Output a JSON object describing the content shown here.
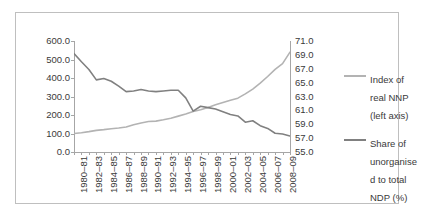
{
  "chart_data": {
    "type": "line",
    "title": "",
    "xlabel": "",
    "ylabel": "",
    "grid": false,
    "legend_position": "right",
    "x": [
      "1980-81",
      "1981-82",
      "1982-83",
      "1983-84",
      "1984-85",
      "1985-86",
      "1986-87",
      "1987-88",
      "1988-89",
      "1989-90",
      "1990-91",
      "1991-92",
      "1992-93",
      "1993-94",
      "1994-95",
      "1995-96",
      "1996-97",
      "1997-98",
      "1998-99",
      "1999-2000",
      "2000-01",
      "2001-02",
      "2002-03",
      "2003-04",
      "2004-05",
      "2005-06",
      "2006-07",
      "2007-08",
      "2008-09",
      "2009-10"
    ],
    "xtick_labels": [
      "1980–81",
      "1982–83",
      "1984–85",
      "1986–87",
      "1988–89",
      "1990–91",
      "1992–93",
      "1994–95",
      "1996–97",
      "1998–99",
      "2000–01",
      "2002–03",
      "2004–05",
      "2006–07",
      "2008–09"
    ],
    "xtick_indices": [
      0,
      2,
      4,
      6,
      8,
      10,
      12,
      14,
      16,
      18,
      20,
      22,
      24,
      26,
      28
    ],
    "left_axis": {
      "ylim": [
        0.0,
        600.0
      ],
      "ticks": [
        0.0,
        100.0,
        200.0,
        300.0,
        400.0,
        500.0,
        600.0
      ],
      "tick_labels": [
        "0.0",
        "100.0",
        "200.0",
        "300.0",
        "400.0",
        "500.0",
        "600.0"
      ]
    },
    "right_axis": {
      "ylim": [
        55.0,
        71.0
      ],
      "ticks": [
        55.0,
        57.0,
        59.0,
        61.0,
        63.0,
        65.0,
        67.0,
        69.0,
        71.0
      ],
      "tick_labels": [
        "55.0",
        "57.0",
        "59.0",
        "61.0",
        "63.0",
        "65.0",
        "67.0",
        "69.0",
        "71.0"
      ]
    },
    "series": [
      {
        "name": "Index of real NNP (left axis)",
        "legend_label": "Index of\nreal NNP\n(left axis)",
        "axis": "left",
        "color": "#b3b3b3",
        "values": [
          100.0,
          104.0,
          110.0,
          117.0,
          121.0,
          126.0,
          130.0,
          135.0,
          147.0,
          157.0,
          165.0,
          167.0,
          174.0,
          182.0,
          194.0,
          205.0,
          219.0,
          228.0,
          240.0,
          255.0,
          267.0,
          280.0,
          291.0,
          314.0,
          340.0,
          372.0,
          408.0,
          447.0,
          478.0,
          540.0
        ]
      },
      {
        "name": "Share of unorganised to total NDP (%)",
        "legend_label": "Share of\nunorganise\nd to total\nNDP (%)",
        "axis": "right",
        "color": "#808080",
        "values": [
          69.2,
          68.0,
          66.9,
          65.4,
          65.6,
          65.2,
          64.5,
          63.7,
          63.8,
          64.0,
          63.8,
          63.7,
          63.8,
          63.9,
          63.9,
          62.8,
          60.9,
          61.6,
          61.4,
          61.2,
          60.8,
          60.4,
          60.2,
          59.3,
          59.5,
          58.8,
          58.4,
          57.7,
          57.6,
          57.3
        ]
      }
    ]
  }
}
